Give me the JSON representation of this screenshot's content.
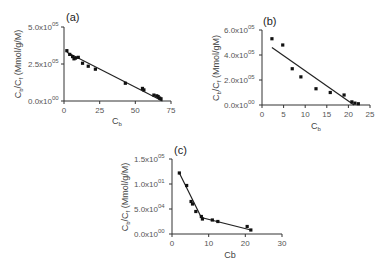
{
  "chart_data": [
    {
      "id": "a",
      "type": "scatter",
      "panel_label": "(a)",
      "xlabel": "Cb",
      "ylabel": "Cb/Cf (Mmol/g/M)",
      "xlim": [
        0,
        75
      ],
      "ylim": [
        0,
        500000
      ],
      "xticks": [
        "0",
        "25",
        "50",
        "75"
      ],
      "yticks": [
        "0.0x10^00",
        "2.5x10^05",
        "5.0x10^05"
      ],
      "grid": false,
      "points": [
        [
          2,
          340000
        ],
        [
          4,
          315000
        ],
        [
          6,
          300000
        ],
        [
          7,
          285000
        ],
        [
          8,
          290000
        ],
        [
          10,
          295000
        ],
        [
          13,
          255000
        ],
        [
          17,
          235000
        ],
        [
          22,
          215000
        ],
        [
          43,
          120000
        ],
        [
          55,
          85000
        ],
        [
          56,
          75000
        ],
        [
          63,
          40000
        ],
        [
          65,
          35000
        ],
        [
          66,
          30000
        ],
        [
          67,
          20000
        ],
        [
          68,
          15000
        ]
      ],
      "fit_line": [
        [
          2,
          330000
        ],
        [
          69,
          0
        ]
      ]
    },
    {
      "id": "b",
      "type": "scatter",
      "panel_label": "(b)",
      "xlabel": "Cb",
      "ylabel": "Cb/Cf (Mmol/gM)",
      "xlim": [
        0,
        25
      ],
      "ylim": [
        0,
        600000
      ],
      "xticks": [
        "0",
        "5",
        "10",
        "15",
        "20",
        "25"
      ],
      "yticks": [
        "0.0x10^00",
        "2.0x10^05",
        "4.0x10^05",
        "6.0x10^05"
      ],
      "grid": false,
      "points": [
        [
          2.3,
          530000
        ],
        [
          4.8,
          480000
        ],
        [
          7,
          290000
        ],
        [
          9,
          225000
        ],
        [
          12.5,
          130000
        ],
        [
          15.8,
          100000
        ],
        [
          19,
          80000
        ],
        [
          20.8,
          25000
        ],
        [
          21.5,
          15000
        ],
        [
          22.3,
          10000
        ]
      ],
      "fit_line": [
        [
          2.3,
          460000
        ],
        [
          21.3,
          0
        ]
      ]
    },
    {
      "id": "c",
      "type": "scatter",
      "panel_label": "(c)",
      "xlabel": "Cb",
      "ylabel": "Cb/Cf (Mmol/g/M)",
      "xlim": [
        0,
        30
      ],
      "ylim": [
        0,
        150000
      ],
      "xticks": [
        "0",
        "10",
        "20",
        "30"
      ],
      "yticks": [
        "0.0x10^00",
        "5.0x10^04",
        "1.0x10^01",
        "1.5x10^05"
      ],
      "grid": false,
      "points": [
        [
          2,
          122000
        ],
        [
          4,
          97000
        ],
        [
          5.2,
          65000
        ],
        [
          5.6,
          60000
        ],
        [
          6.5,
          45000
        ],
        [
          8,
          35000
        ],
        [
          8.3,
          30000
        ],
        [
          11,
          28000
        ],
        [
          12.5,
          25000
        ],
        [
          20.5,
          15000
        ],
        [
          21.5,
          8000
        ]
      ],
      "fit_line": [
        [
          2,
          122000
        ],
        [
          8,
          33000
        ],
        [
          21.5,
          8000
        ]
      ]
    }
  ],
  "panels": {
    "a": {
      "label": "(a)",
      "xlabel": "C",
      "xlabel_sub": "b",
      "ylabel": "C",
      "ylabel_sub1": "b",
      "ylabel_mid": "/C",
      "ylabel_sub2": "f",
      "ylabel_units": " (Mmol/g/M)",
      "yticks": [
        {
          "m": "0.0x10",
          "e": "00"
        },
        {
          "m": "2.5x10",
          "e": "05"
        },
        {
          "m": "5.0x10",
          "e": "05"
        }
      ],
      "xticks": [
        "0",
        "25",
        "50",
        "75"
      ]
    },
    "b": {
      "label": "(b)",
      "xlabel": "C",
      "xlabel_sub": "b",
      "ylabel": "C",
      "ylabel_sub1": "b",
      "ylabel_mid": "/C",
      "ylabel_sub2": "f",
      "ylabel_units": " (Mmol/gM)",
      "yticks": [
        {
          "m": "0.0x10",
          "e": "00"
        },
        {
          "m": "2.0x10",
          "e": "05"
        },
        {
          "m": "4.0x10",
          "e": "05"
        },
        {
          "m": "6.0x10",
          "e": "05"
        }
      ],
      "xticks": [
        "0",
        "5",
        "10",
        "15",
        "20",
        "25"
      ]
    },
    "c": {
      "label": "(c)",
      "xlabel": "Cb",
      "ylabel": "C",
      "ylabel_sub1": "b",
      "ylabel_mid": "/C",
      "ylabel_sub2": "f",
      "ylabel_units": " (Mmol/g/M)",
      "yticks": [
        {
          "m": "0.0x10",
          "e": "00"
        },
        {
          "m": "5.0x10",
          "e": "04"
        },
        {
          "m": "1.0x10",
          "e": "01"
        },
        {
          "m": "1.5x10",
          "e": "05"
        }
      ],
      "xticks": [
        "0",
        "10",
        "20",
        "30"
      ]
    }
  }
}
